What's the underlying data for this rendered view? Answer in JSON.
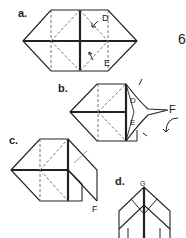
{
  "step_number": "6",
  "colors": {
    "ink": "#222222",
    "fold_line": "#555555",
    "background": "#ffffff"
  },
  "diagrams": [
    {
      "id": "a",
      "label": "a.",
      "points": [
        "D",
        "E"
      ],
      "description": "Hexagonal folded base with valley fold lines and arrows toward D and E"
    },
    {
      "id": "b",
      "label": "b.",
      "points": [
        "D",
        "E",
        "F"
      ],
      "description": "Right side squash folded to point F with rotation arrow"
    },
    {
      "id": "c",
      "label": "c.",
      "points": [
        "F"
      ],
      "description": "Flap F folded down"
    },
    {
      "id": "d",
      "label": "d.",
      "points": [
        "G"
      ],
      "description": "Pointed form with top point G"
    }
  ]
}
